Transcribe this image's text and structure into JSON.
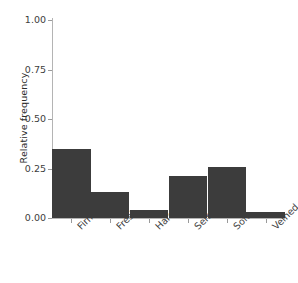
{
  "chart_data": {
    "type": "bar",
    "title": "",
    "subtitle": "",
    "xlabel": "",
    "ylabel": "Relative frequency",
    "categories": [
      "Firm",
      "Fresh",
      "Hard",
      "Semisoft",
      "Soft",
      "Veined"
    ],
    "values": [
      0.35,
      0.13,
      0.04,
      0.21,
      0.26,
      0.03
    ],
    "ylim": [
      0.0,
      1.0
    ],
    "y_ticks": [
      0.0,
      0.25,
      0.5,
      0.75,
      1.0
    ],
    "y_tick_labels": [
      "0.00",
      "0.25",
      "0.50",
      "0.75",
      "1.00"
    ],
    "grid": false,
    "legend": "none",
    "bar_color": "#3c3c3c",
    "axis_color": "#b4b4b4",
    "background_color": "#ffffff",
    "text_color": "#3d3d3d",
    "x_tick_label_rotation": -45
  }
}
